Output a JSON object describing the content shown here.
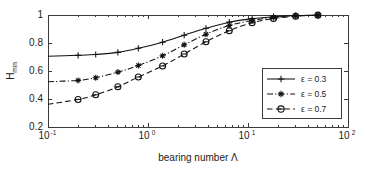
{
  "chart_data": {
    "type": "line",
    "title": "",
    "xlabel": "bearing number Λ",
    "ylabel": "H",
    "ylabel_sub": "min",
    "xscale": "log",
    "yscale": "linear",
    "xlim": [
      0.1,
      100
    ],
    "ylim": [
      0.2,
      1.0
    ],
    "grid": false,
    "legend_position": "lower-right",
    "x_tick_labels": [
      "10",
      "10",
      "10"
    ],
    "x_tick_exponents": [
      "-1",
      "0",
      "2"
    ],
    "x_ticks_full": [
      {
        "base": "10",
        "exp": "-1",
        "value": 0.1
      },
      {
        "base": "10",
        "exp": "0",
        "value": 1
      },
      {
        "base": "10",
        "exp": "1",
        "value": 10
      },
      {
        "base": "10",
        "exp": "2",
        "value": 100
      }
    ],
    "y_ticks": [
      "0.2",
      "0.4",
      "0.6",
      "0.8",
      "1"
    ],
    "y_tick_values": [
      0.2,
      0.4,
      0.6,
      0.8,
      1.0
    ],
    "series": [
      {
        "name": "ε = 0.3",
        "epsilon": 0.3,
        "linestyle": "solid",
        "marker": "plus",
        "x": [
          0.1,
          0.2,
          0.3,
          0.5,
          0.8,
          1.4,
          2.3,
          3.8,
          6.5,
          11,
          18,
          30,
          50
        ],
        "y": [
          0.705,
          0.712,
          0.718,
          0.733,
          0.762,
          0.806,
          0.856,
          0.905,
          0.949,
          0.974,
          0.988,
          0.996,
          0.999
        ]
      },
      {
        "name": "ε = 0.5",
        "epsilon": 0.5,
        "linestyle": "dashdot",
        "marker": "asterisk",
        "x": [
          0.1,
          0.2,
          0.3,
          0.5,
          0.8,
          1.4,
          2.3,
          3.8,
          6.5,
          11,
          18,
          30,
          50
        ],
        "y": [
          0.523,
          0.533,
          0.552,
          0.592,
          0.639,
          0.709,
          0.787,
          0.863,
          0.925,
          0.962,
          0.982,
          0.994,
          0.999
        ]
      },
      {
        "name": "ε = 0.7",
        "epsilon": 0.7,
        "linestyle": "dashed",
        "marker": "circle",
        "x": [
          0.1,
          0.2,
          0.3,
          0.5,
          0.8,
          1.4,
          2.3,
          3.8,
          6.5,
          11,
          18,
          30,
          50
        ],
        "y": [
          0.362,
          0.397,
          0.43,
          0.487,
          0.557,
          0.636,
          0.721,
          0.809,
          0.888,
          0.944,
          0.975,
          0.991,
          0.999
        ]
      }
    ],
    "legend_entries": [
      {
        "label": "ε = 0.3",
        "linestyle": "solid",
        "marker": "plus"
      },
      {
        "label": "ε = 0.5",
        "linestyle": "dashdot",
        "marker": "asterisk"
      },
      {
        "label": "ε = 0.7",
        "linestyle": "dashed",
        "marker": "circle"
      }
    ],
    "colors": {
      "line": "#111111",
      "axis": "#3a3a3a",
      "text": "#1a1a1a",
      "background": "#ffffff"
    }
  }
}
